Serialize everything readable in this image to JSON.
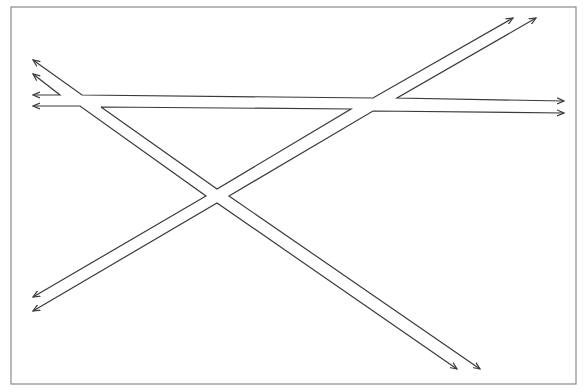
{
  "diagram": {
    "width": 588,
    "height": 392,
    "colors": {
      "background": "#ffffff",
      "frame": "#8a8a8a",
      "line": "#3a3a3a"
    },
    "frame": {
      "x": 11,
      "y": 7,
      "width": 565,
      "height": 377
    },
    "paths": [
      {
        "name": "upper-left-to-upper-horizontal",
        "points": [
          [
            33,
            60
          ],
          [
            82,
            95
          ],
          [
            373,
            98
          ],
          [
            513,
            18
          ]
        ],
        "arrow_start": true,
        "arrow_end": true
      },
      {
        "name": "left-short-loop",
        "points": [
          [
            33,
            74
          ],
          [
            60,
            95
          ],
          [
            33,
            95
          ]
        ],
        "arrow_start": true,
        "arrow_end": true
      },
      {
        "name": "upper-right-horizontal",
        "points": [
          [
            564,
            101
          ],
          [
            397,
            98
          ],
          [
            536,
            18
          ]
        ],
        "arrow_start": true,
        "arrow_end": true
      },
      {
        "name": "left-lower-horizontal-to-diagonal",
        "points": [
          [
            33,
            106
          ],
          [
            80,
            106
          ],
          [
            206,
            196
          ],
          [
            33,
            297
          ]
        ],
        "arrow_start": true,
        "arrow_end": true
      },
      {
        "name": "inner-triangle-top",
        "points": [
          [
            101,
            107
          ],
          [
            351,
            109
          ],
          [
            217,
            189
          ],
          [
            101,
            107
          ]
        ],
        "arrow_start": false,
        "arrow_end": false
      },
      {
        "name": "right-lower-horizontal",
        "points": [
          [
            564,
            113
          ],
          [
            373,
            111
          ],
          [
            229,
            196
          ],
          [
            480,
            369
          ]
        ],
        "arrow_start": true,
        "arrow_end": true
      },
      {
        "name": "bottom-diagonal",
        "points": [
          [
            33,
            311
          ],
          [
            217,
            203
          ],
          [
            457,
            369
          ]
        ],
        "arrow_start": true,
        "arrow_end": true
      }
    ]
  }
}
